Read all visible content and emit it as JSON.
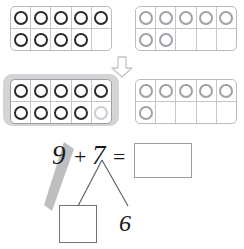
{
  "worksheet": {
    "title": "Make-a-ten addition with ten frames",
    "equation": {
      "addend1": "9",
      "plus": "+",
      "addend2": "7",
      "equals": "=",
      "sum": "",
      "sum_placeholder": ""
    },
    "number_bond": {
      "whole": "7",
      "part_left": "",
      "part_left_placeholder": "",
      "part_right": "6"
    },
    "transition_icon": "down-arrow-icon"
  },
  "ten_frames": [
    {
      "id": "top-left",
      "name": "first-addend-frame",
      "label": "9",
      "highlighted": false,
      "rows": [
        [
          "dark",
          "dark",
          "dark",
          "dark",
          "dark"
        ],
        [
          "dark",
          "dark",
          "dark",
          "dark",
          "empty"
        ]
      ],
      "filled_count": 9
    },
    {
      "id": "top-right",
      "name": "second-addend-frame",
      "label": "7",
      "highlighted": false,
      "rows": [
        [
          "gray",
          "gray",
          "gray",
          "gray",
          "gray"
        ],
        [
          "gray",
          "gray",
          "empty",
          "empty",
          "empty"
        ]
      ],
      "filled_count": 7
    },
    {
      "id": "bottom-left",
      "name": "completed-ten-frame",
      "label": "10",
      "highlighted": true,
      "rows": [
        [
          "dark",
          "dark",
          "dark",
          "dark",
          "dark"
        ],
        [
          "dark",
          "dark",
          "dark",
          "dark",
          "faint"
        ]
      ],
      "filled_count": 10
    },
    {
      "id": "bottom-right",
      "name": "remainder-frame",
      "label": "6",
      "highlighted": false,
      "rows": [
        [
          "gray",
          "gray",
          "gray",
          "gray",
          "gray"
        ],
        [
          "gray",
          "empty",
          "empty",
          "empty",
          "empty"
        ]
      ],
      "filled_count": 6
    }
  ],
  "colors": {
    "dark_dot": "#2b2b2b",
    "gray_dot": "#9ea2a6",
    "faint_dot": "#c9ccd0",
    "frame_border": "#b9bcc0",
    "highlight_bg": "#d2d4d6",
    "swipe": "#bcbec0",
    "text": "#1a1a1a"
  }
}
